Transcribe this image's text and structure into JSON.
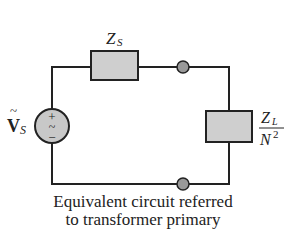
{
  "diagram": {
    "type": "circuit-schematic",
    "caption": {
      "line1": "Equivalent circuit referred",
      "line2": "to transformer primary"
    },
    "components": {
      "source": {
        "label_main": "V",
        "label_sub": "S",
        "label_accent": "~",
        "plus": "+",
        "ac": "~",
        "minus": "−",
        "fill": "#c8c8c8"
      },
      "series_impedance": {
        "label_main": "Z",
        "label_sub": "S",
        "fill": "#cfcfcf"
      },
      "load_impedance": {
        "numerator_main": "Z",
        "numerator_sub": "L",
        "denominator_main": "N",
        "denominator_sup": "2",
        "fill": "#cfcfcf"
      },
      "terminals": [
        {
          "position": "top",
          "fill": "#999999"
        },
        {
          "position": "bottom",
          "fill": "#999999"
        }
      ]
    },
    "colors": {
      "wire": "#222222",
      "background": "#ffffff"
    }
  }
}
